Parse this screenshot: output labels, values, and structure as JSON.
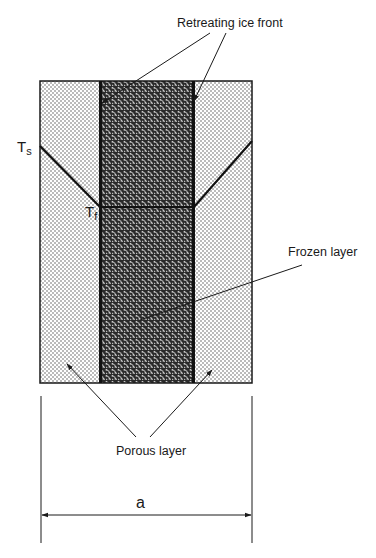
{
  "diagram": {
    "labels": {
      "retreating_ice_front": "Retreating ice front",
      "frozen_layer": "Frozen layer",
      "porous_layer": "Porous layer",
      "ts_main": "T",
      "ts_sub": "s",
      "tf_main": "T",
      "tf_sub": "f",
      "width": "a"
    },
    "regions": [
      {
        "name": "left-porous-layer",
        "pattern": "fine-dots"
      },
      {
        "name": "frozen-layer",
        "pattern": "dense-speckle"
      },
      {
        "name": "right-porous-layer",
        "pattern": "fine-dots"
      }
    ],
    "colors": {
      "line": "#1a1a1a",
      "background": "#ffffff"
    }
  }
}
